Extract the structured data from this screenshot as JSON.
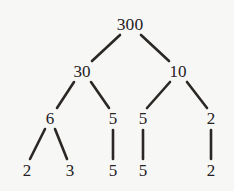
{
  "figure": {
    "background_color": "#f7f7f5",
    "edge_color": "#2b2725",
    "text_color": "#25211f"
  },
  "chart_data": {
    "type": "diagram",
    "subtype": "factor-tree",
    "root_value": "300",
    "levels": [
      [
        "300"
      ],
      [
        "30",
        "10"
      ],
      [
        "6",
        "5",
        "5",
        "2"
      ],
      [
        "2",
        "3",
        "5",
        "5",
        "2"
      ]
    ],
    "nodes": [
      {
        "id": "n300",
        "label": "300",
        "x": 130,
        "y": 25,
        "level": 0
      },
      {
        "id": "n30",
        "label": "30",
        "x": 82,
        "y": 71,
        "level": 1
      },
      {
        "id": "n10",
        "label": "10",
        "x": 178,
        "y": 71,
        "level": 1
      },
      {
        "id": "n6",
        "label": "6",
        "x": 50,
        "y": 118,
        "level": 2
      },
      {
        "id": "n5a",
        "label": "5",
        "x": 113,
        "y": 118,
        "level": 2
      },
      {
        "id": "n5b",
        "label": "5",
        "x": 143,
        "y": 118,
        "level": 2
      },
      {
        "id": "n2a",
        "label": "2",
        "x": 211,
        "y": 118,
        "level": 2
      },
      {
        "id": "l2",
        "label": "2",
        "x": 27,
        "y": 170,
        "level": 3
      },
      {
        "id": "l3",
        "label": "3",
        "x": 70,
        "y": 170,
        "level": 3
      },
      {
        "id": "l5a",
        "label": "5",
        "x": 113,
        "y": 170,
        "level": 3
      },
      {
        "id": "l5b",
        "label": "5",
        "x": 143,
        "y": 170,
        "level": 3
      },
      {
        "id": "l2b",
        "label": "2",
        "x": 211,
        "y": 170,
        "level": 3
      }
    ],
    "edges": [
      {
        "from": "n300",
        "to": "n30",
        "x1": 120,
        "y1": 35,
        "x2": 92,
        "y2": 61
      },
      {
        "from": "n300",
        "to": "n10",
        "x1": 141,
        "y1": 35,
        "x2": 169,
        "y2": 61
      },
      {
        "from": "n30",
        "to": "n6",
        "x1": 74,
        "y1": 82,
        "x2": 57,
        "y2": 108
      },
      {
        "from": "n30",
        "to": "n5a",
        "x1": 91,
        "y1": 82,
        "x2": 109,
        "y2": 108
      },
      {
        "from": "n10",
        "to": "n5b",
        "x1": 170,
        "y1": 82,
        "x2": 147,
        "y2": 108
      },
      {
        "from": "n10",
        "to": "n2a",
        "x1": 187,
        "y1": 82,
        "x2": 207,
        "y2": 108
      },
      {
        "from": "n6",
        "to": "l2",
        "x1": 45,
        "y1": 129,
        "x2": 30,
        "y2": 159
      },
      {
        "from": "n6",
        "to": "l3",
        "x1": 55,
        "y1": 129,
        "x2": 67,
        "y2": 159
      },
      {
        "from": "n5a",
        "to": "l5a",
        "x1": 113,
        "y1": 130,
        "x2": 113,
        "y2": 159
      },
      {
        "from": "n5b",
        "to": "l5b",
        "x1": 143,
        "y1": 130,
        "x2": 143,
        "y2": 159
      },
      {
        "from": "n2a",
        "to": "l2b",
        "x1": 211,
        "y1": 130,
        "x2": 211,
        "y2": 159
      }
    ]
  }
}
